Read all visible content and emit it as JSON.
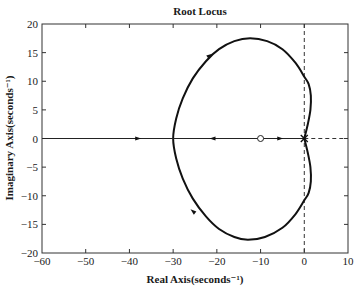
{
  "chart_data": {
    "type": "line",
    "title": "Root Locus",
    "xlabel": "Real Axis(seconds⁻¹)",
    "ylabel": "Imaginary Axis(seconds⁻¹)",
    "xlim": [
      -60,
      10
    ],
    "ylim": [
      -20,
      20
    ],
    "xticks": [
      -60,
      -50,
      -40,
      -30,
      -20,
      -10,
      0,
      10
    ],
    "yticks": [
      -20,
      -15,
      -10,
      -5,
      0,
      5,
      10,
      15,
      20
    ],
    "xtick_labels": [
      "−60",
      "−50",
      "−40",
      "−30",
      "−20",
      "−10",
      "0",
      "10"
    ],
    "ytick_labels": [
      "−20",
      "−15",
      "−10",
      "−5",
      "0",
      "5",
      "10",
      "15",
      "20"
    ],
    "grid": false,
    "legend": null,
    "poles": [
      {
        "re": 0,
        "im": 0,
        "marker": "x"
      }
    ],
    "zeros": [
      {
        "re": -10,
        "im": 0,
        "marker": "o"
      }
    ],
    "series": [
      {
        "name": "locus-branch-loop",
        "points": [
          [
            0,
            0
          ],
          [
            0.8,
            2.5
          ],
          [
            1.4,
            5
          ],
          [
            1.5,
            7.5
          ],
          [
            1.0,
            9.5
          ],
          [
            0,
            10.8
          ],
          [
            -2,
            13.2
          ],
          [
            -5,
            15.6
          ],
          [
            -8.5,
            17.0
          ],
          [
            -12.4,
            17.5
          ],
          [
            -16,
            17.0
          ],
          [
            -19.5,
            15.6
          ],
          [
            -22.5,
            13.5
          ],
          [
            -25.5,
            10.5
          ],
          [
            -27.8,
            7
          ],
          [
            -29.3,
            3.5
          ],
          [
            -30,
            0
          ],
          [
            -29.3,
            -3.5
          ],
          [
            -27.8,
            -7
          ],
          [
            -25.5,
            -10.5
          ],
          [
            -22.5,
            -13.6
          ],
          [
            -19.5,
            -15.8
          ],
          [
            -16,
            -17.2
          ],
          [
            -12.9,
            -17.7
          ],
          [
            -9,
            -17.2
          ],
          [
            -5,
            -15.6
          ],
          [
            -2,
            -13.2
          ],
          [
            0,
            -10.8
          ],
          [
            1.0,
            -9.5
          ],
          [
            1.5,
            -7.5
          ],
          [
            1.4,
            -5
          ],
          [
            0.8,
            -2.5
          ],
          [
            0,
            0
          ]
        ]
      },
      {
        "name": "locus-real-axis-left",
        "points": [
          [
            -60,
            0
          ],
          [
            -30,
            0
          ]
        ]
      },
      {
        "name": "locus-real-axis-segment",
        "points": [
          [
            -30,
            0
          ],
          [
            0,
            0
          ]
        ]
      }
    ],
    "arrows": [
      {
        "re": -38,
        "im": 0,
        "dir": "right"
      },
      {
        "re": -21,
        "im": 0,
        "dir": "left"
      },
      {
        "re": -5.5,
        "im": 0,
        "dir": "right"
      },
      {
        "re": -21.6,
        "im": 14.5,
        "dir": "up-right"
      },
      {
        "re": -25.5,
        "im": -12.7,
        "dir": "up-left"
      }
    ],
    "annotations": {
      "jw_axis_dashed": true,
      "real_axis_dashed_positive": true
    }
  },
  "plot": {
    "frame": {
      "left": 42,
      "top": 24,
      "right": 348,
      "bottom": 253
    }
  }
}
